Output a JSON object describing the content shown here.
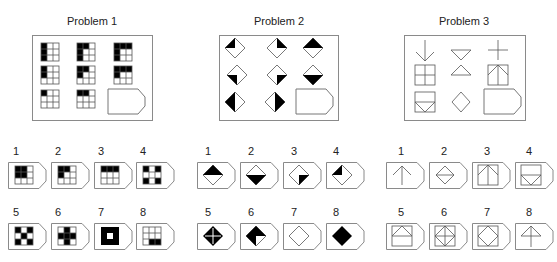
{
  "problems": [
    {
      "title": "Problem 1",
      "matrix_type": "3x3 grid, L-shape black fill: rows = fill height (3,2,1), cols = fill width (1,2,3)",
      "matrix": [
        [
          {
            "h": 3,
            "w": 1
          },
          {
            "h": 3,
            "w": 2
          },
          {
            "h": 3,
            "w": 3
          }
        ],
        [
          {
            "h": 2,
            "w": 1
          },
          {
            "h": 2,
            "w": 2
          },
          {
            "h": 2,
            "w": 3
          }
        ],
        [
          {
            "h": 1,
            "w": 1
          },
          {
            "h": 1,
            "w": 2
          },
          "blank-answer-slot"
        ]
      ],
      "options": [
        {
          "label": "1",
          "desc": "top-left 2x2 black block"
        },
        {
          "label": "2",
          "desc": "L: top row 2 wide + left column 2 high"
        },
        {
          "label": "3",
          "desc": "top row fully black"
        },
        {
          "label": "4",
          "desc": "four corners black"
        },
        {
          "label": "5",
          "desc": "checkerboard, center white-ish pattern"
        },
        {
          "label": "6",
          "desc": "plus shape black"
        },
        {
          "label": "7",
          "desc": "all black except center white"
        },
        {
          "label": "8",
          "desc": "bottom-right 2 cells black"
        }
      ]
    },
    {
      "title": "Problem 2",
      "matrix_type": "diamonds with black quarter/half",
      "matrix": [
        [
          "top-left quarter black",
          "top-right quarter black",
          "top half black"
        ],
        [
          "bottom-left quarter black",
          "bottom-right quarter black",
          "bottom half black"
        ],
        [
          "left half black",
          "right half black",
          "blank-answer-slot"
        ]
      ],
      "options": [
        {
          "label": "1",
          "desc": "top half black"
        },
        {
          "label": "2",
          "desc": "bottom half black"
        },
        {
          "label": "3",
          "desc": "bottom-right quarter black"
        },
        {
          "label": "4",
          "desc": "top-left quarter black"
        },
        {
          "label": "5",
          "desc": "all black with white cross"
        },
        {
          "label": "6",
          "desc": "top-left and bottom-right... alternating quarters black"
        },
        {
          "label": "7",
          "desc": "all white"
        },
        {
          "label": "8",
          "desc": "all black"
        }
      ]
    },
    {
      "title": "Problem 3",
      "matrix_type": "line figures, row3 = row1 superimposed on row2",
      "matrix": [
        [
          "down arrow",
          "hourglass triangles",
          "plus"
        ],
        [
          "square with cross",
          "two triangles",
          "square with up arrow"
        ],
        [
          "square with V triangle",
          "diamond",
          "blank-answer-slot"
        ]
      ],
      "options": [
        {
          "label": "1",
          "desc": "up arrow"
        },
        {
          "label": "2",
          "desc": "diamond with horizontal line"
        },
        {
          "label": "3",
          "desc": "square with up arrow"
        },
        {
          "label": "4",
          "desc": "square with down V"
        },
        {
          "label": "5",
          "desc": "square with roof and horizontal line"
        },
        {
          "label": "6",
          "desc": "square with diamond and cross"
        },
        {
          "label": "7",
          "desc": "square with diamond"
        },
        {
          "label": "8",
          "desc": "up arrow with horizontal base line"
        }
      ]
    }
  ],
  "colors": {
    "stroke": "#555555",
    "fill": "#000000",
    "frame": "#8a8a8a"
  }
}
